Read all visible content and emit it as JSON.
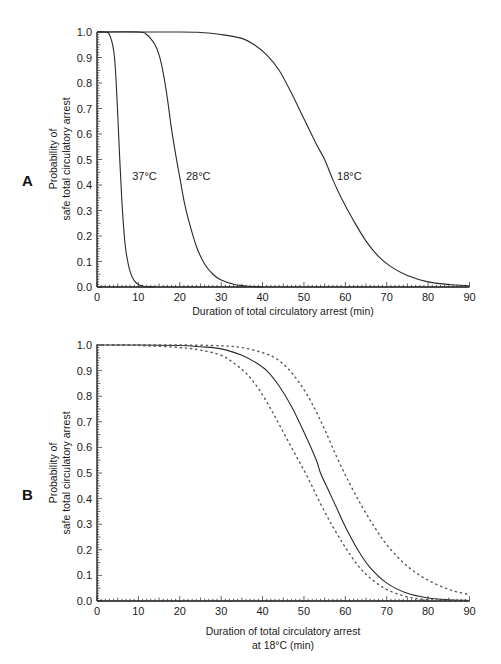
{
  "chart_data": [
    {
      "panel": "A",
      "type": "line",
      "title": "",
      "xlabel": "Duration of total circulatory arrest (min)",
      "ylabel": "Probability of safe total circulatory arrest",
      "xlim": [
        0,
        90
      ],
      "ylim": [
        0.0,
        1.0
      ],
      "x_ticks": [
        0,
        10,
        20,
        30,
        40,
        50,
        60,
        70,
        80,
        90
      ],
      "y_ticks": [
        "0.0",
        "0.1",
        "0.2",
        "0.3",
        "0.4",
        "0.5",
        "0.6",
        "0.7",
        "0.8",
        "0.9",
        "1.0"
      ],
      "grid": false,
      "series": [
        {
          "name": "37°C",
          "style": "solid",
          "x": [
            0,
            2,
            3,
            4,
            4.5,
            5,
            5.5,
            6,
            6.5,
            7,
            8,
            9,
            10,
            11,
            12,
            14
          ],
          "y": [
            1.0,
            1.0,
            0.99,
            0.93,
            0.84,
            0.68,
            0.5,
            0.34,
            0.22,
            0.14,
            0.06,
            0.025,
            0.01,
            0.004,
            0.001,
            0.0
          ]
        },
        {
          "name": "28°C",
          "style": "solid",
          "x": [
            0,
            10,
            12,
            14,
            15,
            16,
            17,
            18,
            19,
            20,
            21,
            22,
            24,
            26,
            28,
            30,
            33,
            36,
            40
          ],
          "y": [
            1.0,
            1.0,
            0.99,
            0.95,
            0.91,
            0.84,
            0.74,
            0.62,
            0.52,
            0.43,
            0.34,
            0.27,
            0.16,
            0.09,
            0.05,
            0.027,
            0.011,
            0.004,
            0.0
          ]
        },
        {
          "name": "18°C",
          "style": "solid",
          "x": [
            0,
            20,
            25,
            30,
            35,
            38,
            41,
            44,
            47,
            50,
            53,
            55,
            57,
            59,
            62,
            65,
            68,
            71,
            75,
            80,
            85,
            90
          ],
          "y": [
            1.0,
            1.0,
            0.998,
            0.99,
            0.975,
            0.95,
            0.91,
            0.85,
            0.76,
            0.66,
            0.56,
            0.5,
            0.42,
            0.35,
            0.26,
            0.18,
            0.12,
            0.08,
            0.045,
            0.02,
            0.01,
            0.005
          ]
        }
      ],
      "annotations": [
        {
          "text": "37°C",
          "x": 8.5,
          "y": 0.42
        },
        {
          "text": "28°C",
          "x": 21.5,
          "y": 0.42
        },
        {
          "text": "18°C",
          "x": 58,
          "y": 0.42
        }
      ],
      "legend": "none"
    },
    {
      "panel": "B",
      "type": "line",
      "title": "",
      "xlabel": "Duration of total circulatory arrest at 18°C (min)",
      "ylabel": "Probability of safe total circulatory arrest",
      "xlim": [
        0,
        90
      ],
      "ylim": [
        0.0,
        1.0
      ],
      "x_ticks": [
        0,
        10,
        20,
        30,
        40,
        50,
        60,
        70,
        80,
        90
      ],
      "y_ticks": [
        "0.0",
        "0.1",
        "0.2",
        "0.3",
        "0.4",
        "0.5",
        "0.6",
        "0.7",
        "0.8",
        "0.9",
        "1.0"
      ],
      "grid": false,
      "series": [
        {
          "name": "Estimate",
          "style": "solid",
          "x": [
            0,
            10,
            20,
            25,
            30,
            35,
            38,
            41,
            44,
            47,
            50,
            53,
            54,
            56,
            58,
            60,
            63,
            66,
            70,
            75,
            80,
            85,
            90
          ],
          "y": [
            1.0,
            1.0,
            0.998,
            0.993,
            0.985,
            0.96,
            0.935,
            0.9,
            0.84,
            0.76,
            0.66,
            0.55,
            0.5,
            0.43,
            0.36,
            0.29,
            0.2,
            0.13,
            0.07,
            0.03,
            0.012,
            0.005,
            0.002
          ]
        },
        {
          "name": "Lower confidence limit",
          "style": "dotted",
          "x": [
            0,
            10,
            20,
            25,
            30,
            33,
            36,
            39,
            42,
            45,
            48,
            51,
            54,
            57,
            60,
            63,
            66,
            70,
            75,
            80,
            85,
            90
          ],
          "y": [
            1.0,
            0.998,
            0.99,
            0.98,
            0.96,
            0.93,
            0.89,
            0.83,
            0.75,
            0.66,
            0.57,
            0.48,
            0.38,
            0.29,
            0.21,
            0.14,
            0.09,
            0.045,
            0.016,
            0.005,
            0.001,
            0.0
          ]
        },
        {
          "name": "Upper confidence limit",
          "style": "dotted",
          "x": [
            0,
            10,
            20,
            30,
            35,
            40,
            43,
            46,
            49,
            52,
            55,
            58,
            61,
            64,
            67,
            70,
            74,
            78,
            82,
            86,
            90
          ],
          "y": [
            1.0,
            1.0,
            1.0,
            0.997,
            0.99,
            0.97,
            0.95,
            0.91,
            0.85,
            0.77,
            0.67,
            0.56,
            0.46,
            0.37,
            0.29,
            0.22,
            0.15,
            0.1,
            0.065,
            0.04,
            0.025
          ]
        }
      ],
      "legend": "none"
    }
  ],
  "panels": {
    "a": {
      "letter": "A",
      "ylabel_line1": "Probability of",
      "ylabel_line2": "safe total circulatory arrest",
      "xlabel_line1": "Duration of total circulatory arrest (min)",
      "xlabel_line2": ""
    },
    "b": {
      "letter": "B",
      "ylabel_line1": "Probability of",
      "ylabel_line2": "safe total circulatory arrest",
      "xlabel_line1": "Duration of total circulatory arrest",
      "xlabel_line2": "at 18°C (min)"
    }
  }
}
